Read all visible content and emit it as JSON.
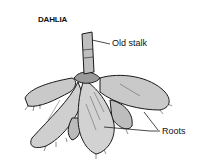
{
  "figure": {
    "title": "DAHLIA",
    "labels": {
      "stalk": "Old stalk",
      "roots": "Roots"
    },
    "colors": {
      "tuber_fill": "#c9c9c9",
      "outline": "#1a1a1a",
      "background": "#ffffff"
    }
  }
}
